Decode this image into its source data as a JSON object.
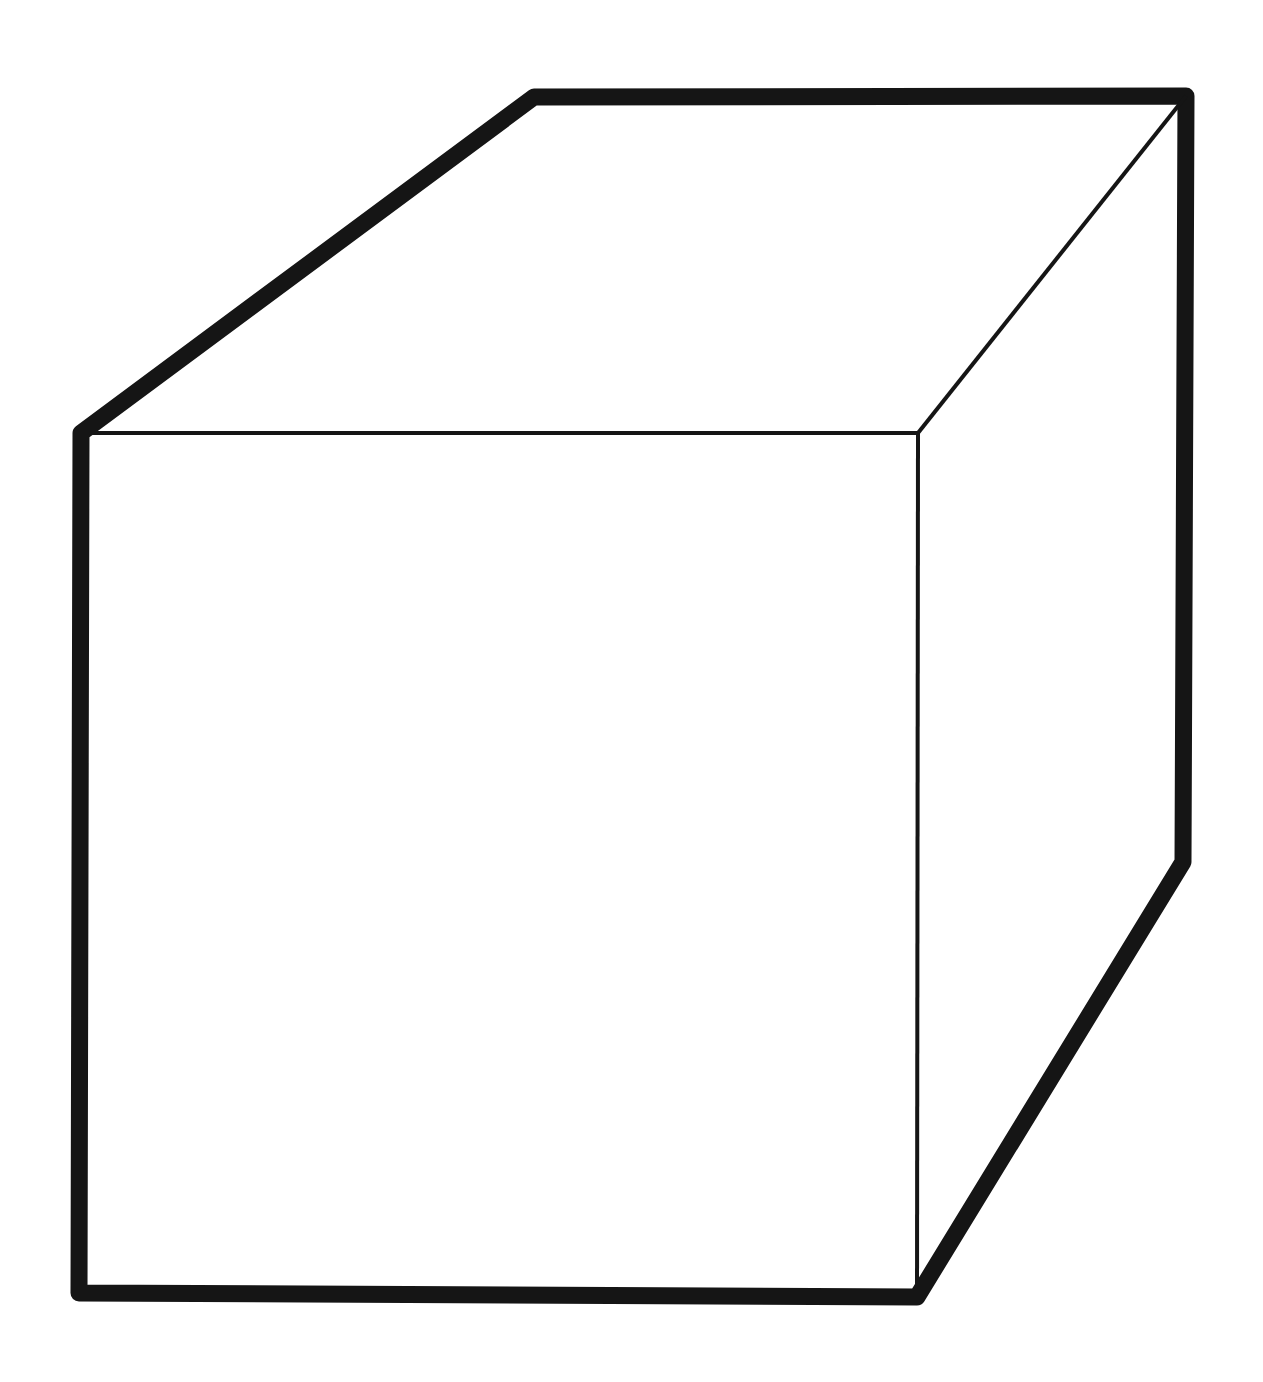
{
  "page": {
    "background_color": "#ffffff"
  },
  "figure": {
    "name": "black outline drawing of a rectangular box (cube) in perspective",
    "type": "line-drawing",
    "stroke_color": "#151515",
    "fill_color": "#ffffff",
    "outline_stroke_width": 17,
    "inner_stroke_width": 4,
    "canvas": {
      "width": 1263,
      "height": 1382
    },
    "vertices": {
      "front_top_left": [
        81,
        433
      ],
      "back_top_left": [
        534,
        97
      ],
      "back_top_right": [
        1186,
        96
      ],
      "front_top_right": [
        918,
        433
      ],
      "back_bottom_right": [
        1183,
        862
      ],
      "front_bottom_right": [
        917,
        1297
      ],
      "front_bottom_left": [
        79,
        1293
      ]
    },
    "silhouette_order": [
      "front_top_left",
      "back_top_left",
      "back_top_right",
      "back_bottom_right",
      "front_bottom_right",
      "front_bottom_left"
    ],
    "inner_edges": [
      {
        "name": "front-face-top-edge",
        "from": "front_top_left",
        "to": "front_top_right"
      },
      {
        "name": "front-face-right-edge",
        "from": "front_top_right",
        "to": "front_bottom_right"
      },
      {
        "name": "top-face-right-edge",
        "from": "front_top_right",
        "to": "back_top_right"
      }
    ]
  }
}
